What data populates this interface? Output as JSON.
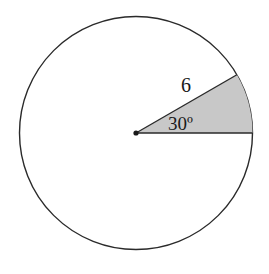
{
  "diagram": {
    "type": "circle-sector",
    "radius_label": "6",
    "angle_label": "30º",
    "colors": {
      "stroke": "#2a2a2a",
      "sector_fill": "#c8c8c8",
      "background": "#ffffff"
    }
  }
}
